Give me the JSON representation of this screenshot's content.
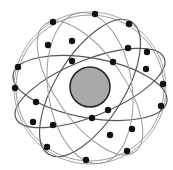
{
  "diagram": {
    "colors": {
      "background": "#ffffff",
      "earth_fill": "#a9a9a9",
      "earth_stroke": "#222222",
      "orbit_dark": "#555555",
      "orbit_light": "#9a9a9a",
      "satellite": "#111111"
    },
    "earth": {
      "cx": 90,
      "cy": 87,
      "r": 20
    },
    "orbits": [
      {
        "cx": 90,
        "cy": 88,
        "rx": 74,
        "ry": 73,
        "rot": 0,
        "tone": "light"
      },
      {
        "cx": 90,
        "cy": 88,
        "rx": 78,
        "ry": 30,
        "rot": 10,
        "tone": "dark"
      },
      {
        "cx": 90,
        "cy": 88,
        "rx": 80,
        "ry": 28,
        "rot": -22,
        "tone": "dark"
      },
      {
        "cx": 90,
        "cy": 88,
        "rx": 78,
        "ry": 34,
        "rot": -58,
        "tone": "dark"
      },
      {
        "cx": 90,
        "cy": 88,
        "rx": 78,
        "ry": 34,
        "rot": 55,
        "tone": "light"
      },
      {
        "cx": 90,
        "cy": 88,
        "rx": 76,
        "ry": 42,
        "rot": 82,
        "tone": "light"
      }
    ],
    "satellites": [
      [
        95,
        14
      ],
      [
        53,
        22
      ],
      [
        129,
        24
      ],
      [
        72,
        41
      ],
      [
        48,
        45
      ],
      [
        128,
        48
      ],
      [
        147,
        52
      ],
      [
        72,
        61
      ],
      [
        113,
        62
      ],
      [
        18,
        67
      ],
      [
        146,
        69
      ],
      [
        15,
        88
      ],
      [
        163,
        84
      ],
      [
        36,
        102
      ],
      [
        161,
        106
      ],
      [
        108,
        110
      ],
      [
        92,
        118
      ],
      [
        33,
        122
      ],
      [
        53,
        125
      ],
      [
        132,
        129
      ],
      [
        110,
        135
      ],
      [
        47,
        147
      ],
      [
        127,
        151
      ],
      [
        86,
        160
      ]
    ],
    "satellite_radius": 3.2
  }
}
